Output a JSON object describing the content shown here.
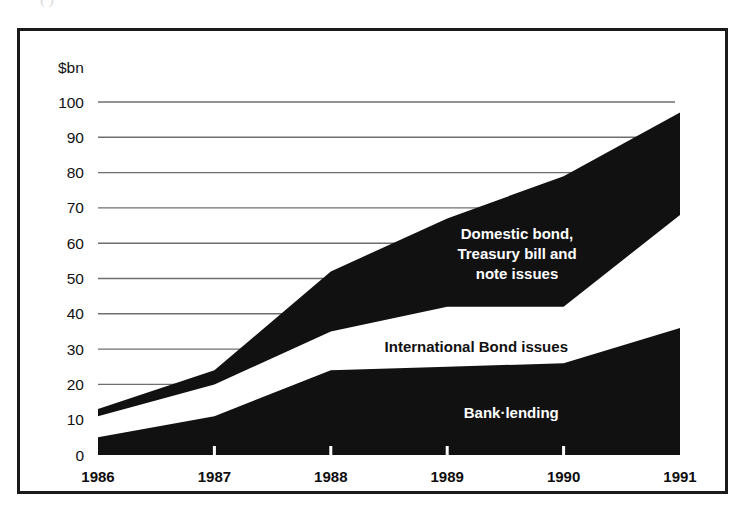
{
  "figure": {
    "scan_artifact_text": "(                )",
    "frame_color": "#1a1a1a",
    "background_color": "#ffffff"
  },
  "chart_data": {
    "type": "area",
    "stacked": true,
    "title": "",
    "subtitle": "",
    "xlabel": "",
    "ylabel": "$bn",
    "unit_label": "$bn",
    "categories": [
      "1986",
      "1987",
      "1988",
      "1989",
      "1990",
      "1991"
    ],
    "x": [
      1986,
      1987,
      1988,
      1989,
      1990,
      1991
    ],
    "xlim": [
      1986,
      1991
    ],
    "ylim": [
      0,
      100
    ],
    "yticks": [
      0,
      10,
      20,
      30,
      40,
      50,
      60,
      70,
      80,
      90,
      100
    ],
    "ytick_labels": [
      "0",
      "10",
      "20",
      "30",
      "40",
      "50",
      "60",
      "70",
      "80",
      "90",
      "100"
    ],
    "grid": true,
    "grid_axis": "y",
    "grid_color": "#6e6e6e",
    "legend": "in-plot-labels",
    "series": [
      {
        "name": "Bank lending",
        "label": "Bank·lending",
        "color": "#111111",
        "text_color": "#ffffff",
        "values": [
          5,
          11,
          24,
          25,
          26,
          36
        ],
        "cumulative": [
          5,
          11,
          24,
          25,
          26,
          36
        ],
        "label_x": 1989.55,
        "label_y": 12
      },
      {
        "name": "International Bond issues",
        "label": "International Bond issues",
        "color": "#ffffff",
        "text_color": "#111111",
        "values": [
          6,
          9,
          11,
          17,
          16,
          32
        ],
        "cumulative": [
          11,
          20,
          35,
          42,
          42,
          68
        ],
        "label_x": 1989.25,
        "label_y": 30.5
      },
      {
        "name": "Domestic bond, Treasury bill and note issues",
        "label_lines": [
          "Domestic bond,",
          "Treasury bill and",
          "note issues"
        ],
        "color": "#111111",
        "text_color": "#ffffff",
        "values": [
          2,
          4,
          17,
          25,
          37,
          29
        ],
        "cumulative": [
          13,
          24,
          52,
          67,
          79,
          97
        ],
        "label_x": 1989.6,
        "label_y": 57
      }
    ],
    "annotations": [
      {
        "text": "Domestic bond,",
        "color": "#ffffff"
      },
      {
        "text": "Treasury bill and",
        "color": "#ffffff"
      },
      {
        "text": "note issues",
        "color": "#ffffff"
      },
      {
        "text": "International Bond issues",
        "color": "#111111"
      },
      {
        "text": "Bank·lending",
        "color": "#ffffff"
      }
    ]
  }
}
